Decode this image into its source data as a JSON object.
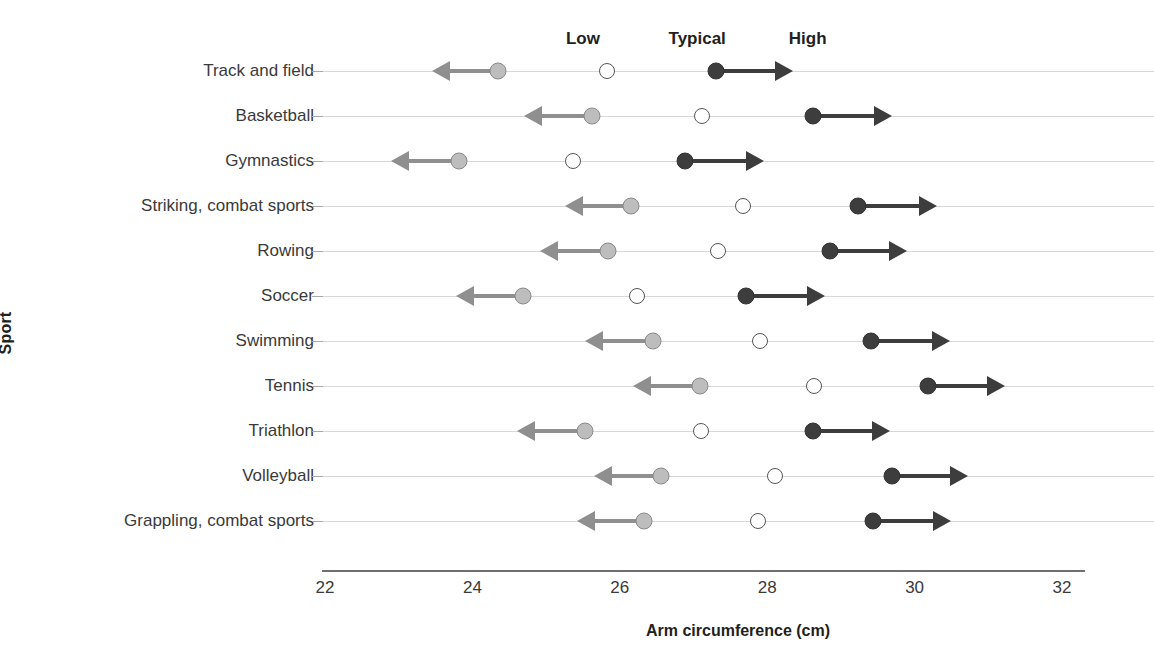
{
  "chart_data": {
    "type": "scatter",
    "title": "",
    "xlabel": "Arm circumference (cm)",
    "ylabel": "Sport",
    "xlim": [
      22,
      32.8
    ],
    "xticks": [
      22,
      24,
      26,
      28,
      30,
      32
    ],
    "xtick_labels": [
      "22",
      "24",
      "26",
      "28",
      "30",
      "32"
    ],
    "grid": true,
    "legend_position": "top",
    "series": [
      {
        "name": "Low",
        "marker": "filled-gray-circle-with-left-arrow",
        "color": "#bdbdbd"
      },
      {
        "name": "Typical",
        "marker": "open-circle",
        "color": "#ffffff"
      },
      {
        "name": "High",
        "marker": "filled-dark-circle-with-right-arrow",
        "color": "#3d3d3d"
      }
    ],
    "categories": [
      "Track and field",
      "Basketball",
      "Gymnastics",
      "Striking, combat sports",
      "Rowing",
      "Soccer",
      "Swimming",
      "Tennis",
      "Triathlon",
      "Volleyball",
      "Grappling, combat sports"
    ],
    "rows": [
      {
        "category": "Track and field",
        "low": 24.35,
        "typical": 25.83,
        "high": 27.3,
        "low_arrow_end": 23.45,
        "high_arrow_end": 28.35
      },
      {
        "category": "Basketball",
        "low": 25.62,
        "typical": 27.11,
        "high": 28.62,
        "low_arrow_end": 24.7,
        "high_arrow_end": 29.7
      },
      {
        "category": "Gymnastics",
        "low": 23.82,
        "typical": 25.37,
        "high": 26.89,
        "low_arrow_end": 22.9,
        "high_arrow_end": 27.95
      },
      {
        "category": "Striking, combat sports",
        "low": 26.15,
        "typical": 27.67,
        "high": 29.23,
        "low_arrow_end": 25.25,
        "high_arrow_end": 30.3
      },
      {
        "category": "Rowing",
        "low": 25.84,
        "typical": 27.33,
        "high": 28.85,
        "low_arrow_end": 24.92,
        "high_arrow_end": 29.9
      },
      {
        "category": "Soccer",
        "low": 24.69,
        "typical": 26.23,
        "high": 27.71,
        "low_arrow_end": 23.78,
        "high_arrow_end": 28.78
      },
      {
        "category": "Swimming",
        "low": 26.45,
        "typical": 27.9,
        "high": 29.41,
        "low_arrow_end": 25.53,
        "high_arrow_end": 30.48
      },
      {
        "category": "Tennis",
        "low": 27.09,
        "typical": 28.64,
        "high": 30.18,
        "low_arrow_end": 26.18,
        "high_arrow_end": 31.23
      },
      {
        "category": "Triathlon",
        "low": 25.53,
        "typical": 27.1,
        "high": 28.62,
        "low_arrow_end": 24.6,
        "high_arrow_end": 29.67
      },
      {
        "category": "Volleyball",
        "low": 26.56,
        "typical": 28.1,
        "high": 29.69,
        "low_arrow_end": 25.65,
        "high_arrow_end": 30.72
      },
      {
        "category": "Grappling, combat sports",
        "low": 26.33,
        "typical": 27.88,
        "high": 29.44,
        "low_arrow_end": 25.42,
        "high_arrow_end": 30.5
      }
    ],
    "band_labels": [
      {
        "text": "Low",
        "x": 25.5
      },
      {
        "text": "Typical",
        "x": 27.05
      },
      {
        "text": "High",
        "x": 28.55
      }
    ]
  },
  "colors": {
    "low": "#bdbdbd",
    "low_stroke": "#8a8a8a",
    "low_arrow": "#8f8f8f",
    "typical_fill": "#ffffff",
    "typical_stroke": "#555555",
    "high": "#3d3d3d",
    "gridline": "#d8d8d8",
    "axis": "#6e6e6e",
    "text": "#231f20"
  }
}
